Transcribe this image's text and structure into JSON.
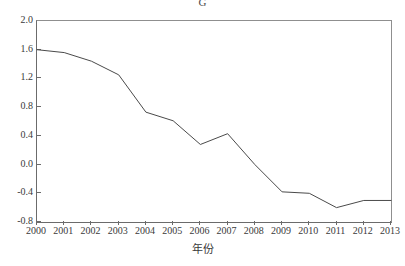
{
  "chart_data": {
    "type": "line",
    "title": "G",
    "xlabel": "年份",
    "ylabel": "",
    "x": [
      2000,
      2001,
      2002,
      2003,
      2004,
      2005,
      2006,
      2007,
      2008,
      2009,
      2010,
      2011,
      2012,
      2013
    ],
    "categories": [
      "2000",
      "2001",
      "2002",
      "2003",
      "2004",
      "2005",
      "2006",
      "2007",
      "2008",
      "2009",
      "2010",
      "2011",
      "2012",
      "2013"
    ],
    "values": [
      1.6,
      1.56,
      1.44,
      1.25,
      0.73,
      0.61,
      0.28,
      0.43,
      0.0,
      -0.38,
      -0.4,
      -0.6,
      -0.5,
      -0.5
    ],
    "series": [
      {
        "name": "G",
        "values": [
          1.6,
          1.56,
          1.44,
          1.25,
          0.73,
          0.61,
          0.28,
          0.43,
          0.0,
          -0.38,
          -0.4,
          -0.6,
          -0.5,
          -0.5
        ]
      }
    ],
    "xlim": [
      2000,
      2013
    ],
    "ylim": [
      -0.8,
      2.0
    ],
    "yticks": [
      -0.8,
      -0.4,
      0.0,
      0.4,
      0.8,
      1.2,
      1.6,
      2.0
    ],
    "ytick_labels": [
      "-0.8",
      "-0.4",
      "0.0",
      "0.4",
      "0.8",
      "1.2",
      "1.6",
      "2.0"
    ],
    "xticks": [
      2000,
      2001,
      2002,
      2003,
      2004,
      2005,
      2006,
      2007,
      2008,
      2009,
      2010,
      2011,
      2012,
      2013
    ],
    "xtick_labels": [
      "2000",
      "2001",
      "2002",
      "2003",
      "2004",
      "2005",
      "2006",
      "2007",
      "2008",
      "2009",
      "2010",
      "2011",
      "2012",
      "2013"
    ],
    "grid": false,
    "legend": false,
    "legend_position": "none",
    "line_color": "#4a4a4a",
    "background_color": "#ffffff",
    "axis_color": "#6b6b6b"
  }
}
